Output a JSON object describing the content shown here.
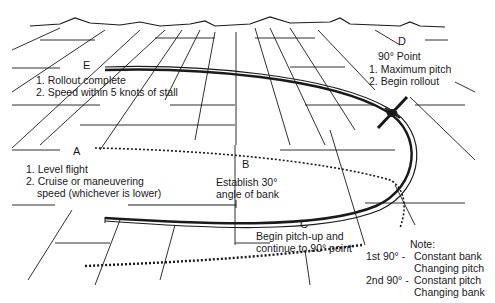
{
  "diagram": {
    "type": "maneuver-illustration",
    "points": {
      "A": {
        "label": "A",
        "lines": [
          "1. Level flight",
          "2. Cruise or maneuvering",
          "speed (whichever is lower)"
        ]
      },
      "B": {
        "label": "B",
        "lines": [
          "Establish 30°",
          "angle of bank"
        ]
      },
      "C": {
        "label": "C",
        "lines": [
          "Begin pitch-up and",
          "continue to 90° point"
        ]
      },
      "D": {
        "label": "D",
        "lines": [
          "90° Point",
          "1. Maximum pitch",
          "2. Begin rollout"
        ]
      },
      "E": {
        "label": "E",
        "lines": [
          "1. Rollout complete",
          "2. Speed within 5 knots of stall"
        ]
      }
    },
    "note": {
      "title": "Note:",
      "rows": [
        {
          "phase": "1st 90° -",
          "lines": [
            "Constant bank",
            "Changing pitch"
          ]
        },
        {
          "phase": "2nd 90° -",
          "lines": [
            "Constant pitch",
            "Changing bank"
          ]
        }
      ]
    },
    "colors": {
      "ink": "#1a1a1a",
      "background": "#ffffff"
    }
  }
}
